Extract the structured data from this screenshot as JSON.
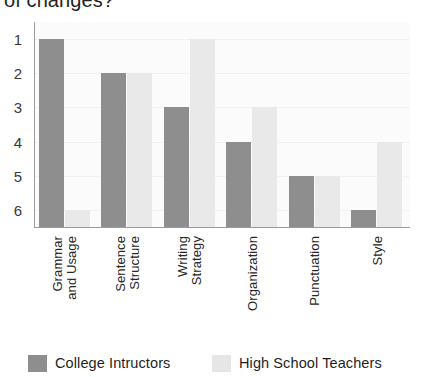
{
  "caption": {
    "text": "of changes?"
  },
  "chart_data": {
    "type": "bar",
    "title": "",
    "subtitle": "",
    "xlabel": "",
    "ylabel": "",
    "categories": [
      "Grammar\nand Usage",
      "Sentence\nStructure",
      "Writing\nStrategy",
      "Organization",
      "Punctuation",
      "Style"
    ],
    "yticks": [
      "1",
      "2",
      "3",
      "4",
      "5",
      "6"
    ],
    "ylim": [
      1,
      6
    ],
    "y_axis_inverted": true,
    "grid": true,
    "legend_position": "bottom",
    "series": [
      {
        "name": "College Intructors",
        "color": "#8e8e8e",
        "values": [
          1,
          2,
          3,
          4,
          5,
          6
        ]
      },
      {
        "name": "High School Teachers",
        "color": "#e9e9e9",
        "values": [
          6,
          2,
          1,
          3,
          5,
          4
        ]
      }
    ]
  },
  "legend": {
    "entries": [
      {
        "label": "College Intructors",
        "swatch": "dark"
      },
      {
        "label": "High School Teachers",
        "swatch": "light"
      }
    ]
  }
}
